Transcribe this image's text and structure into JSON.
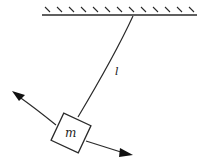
{
  "diagram": {
    "type": "pendulum",
    "labels": {
      "length": "l",
      "mass": "m"
    },
    "colors": {
      "stroke": "#2a2a2a",
      "background": "#ffffff"
    }
  }
}
